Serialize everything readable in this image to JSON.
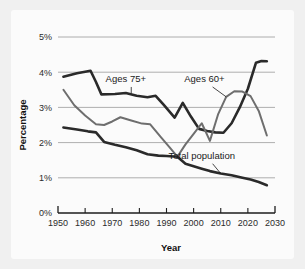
{
  "chart_data": {
    "type": "line",
    "title": "",
    "xlabel": "Year",
    "ylabel": "Percentage",
    "xlim": [
      1950,
      2030
    ],
    "ylim": [
      0,
      5
    ],
    "grid": true,
    "legend_position": "inline-annotations",
    "x_ticks": [
      1950,
      1960,
      1970,
      1980,
      1990,
      2000,
      2010,
      2020,
      2030
    ],
    "x_tick_labels": [
      "1950",
      "1960",
      "1970",
      "1980",
      "1990",
      "2000",
      "2010",
      "2020",
      "2030"
    ],
    "y_ticks": [
      0,
      1,
      2,
      3,
      4,
      5
    ],
    "y_tick_labels": [
      "0%",
      "1%",
      "2%",
      "3%",
      "4%",
      "5%"
    ],
    "series": [
      {
        "name": "Ages 75+",
        "color": "#2a2a2a",
        "width": 2.6,
        "label_x": 1975,
        "label_y": 3.72,
        "x": [
          1952,
          1957,
          1962,
          1964,
          1966,
          1971,
          1975,
          1979,
          1983,
          1986,
          1989,
          1993,
          1996,
          1999,
          2002,
          2005,
          2008,
          2011,
          2014,
          2017,
          2020,
          2023,
          2025,
          2027
        ],
        "y": [
          3.87,
          3.97,
          4.04,
          3.72,
          3.37,
          3.38,
          3.41,
          3.33,
          3.29,
          3.33,
          3.07,
          2.71,
          3.13,
          2.74,
          2.39,
          2.33,
          2.29,
          2.28,
          2.55,
          3.0,
          3.53,
          4.27,
          4.32,
          4.31
        ]
      },
      {
        "name": "Ages 60+",
        "color": "#6e6e6e",
        "width": 2.0,
        "label_x": 2004,
        "label_y": 3.73,
        "x": [
          1952,
          1956,
          1960,
          1964,
          1967,
          1970,
          1973,
          1977,
          1981,
          1984,
          1988,
          1991,
          1994,
          1997,
          2000,
          2003,
          2006,
          2009,
          2012,
          2015,
          2018,
          2021,
          2024,
          2027
        ],
        "y": [
          3.5,
          3.06,
          2.77,
          2.52,
          2.5,
          2.6,
          2.72,
          2.63,
          2.54,
          2.52,
          2.15,
          1.88,
          1.6,
          1.95,
          2.25,
          2.55,
          2.05,
          2.8,
          3.3,
          3.46,
          3.45,
          3.32,
          2.9,
          2.2
        ]
      },
      {
        "name": "Total population",
        "color": "#2a2a2a",
        "width": 2.6,
        "label_x": 2003,
        "label_y": 1.53,
        "x": [
          1952,
          1957,
          1961,
          1964,
          1967,
          1971,
          1975,
          1979,
          1983,
          1987,
          1990,
          1994,
          1997,
          2000,
          2003,
          2006,
          2010,
          2014,
          2018,
          2021,
          2024,
          2027
        ],
        "y": [
          2.43,
          2.37,
          2.32,
          2.29,
          2.02,
          1.94,
          1.87,
          1.78,
          1.67,
          1.63,
          1.62,
          1.6,
          1.4,
          1.33,
          1.26,
          1.19,
          1.12,
          1.07,
          1.0,
          0.95,
          0.88,
          0.79
        ]
      }
    ],
    "annotations": [
      {
        "text": "Ages 75+",
        "leader_from_x": 1977,
        "leader_from_y": 3.58,
        "leader_to_x": 1977,
        "leader_to_y": 3.4
      },
      {
        "text": "Ages 60+",
        "leader_from_x": 2007,
        "leader_from_y": 3.58,
        "leader_to_x": 2012,
        "leader_to_y": 3.3
      },
      {
        "text": "Total population",
        "leader_from_x": 2007,
        "leader_from_y": 1.4,
        "leader_to_x": 2010,
        "leader_to_y": 1.12
      }
    ]
  }
}
